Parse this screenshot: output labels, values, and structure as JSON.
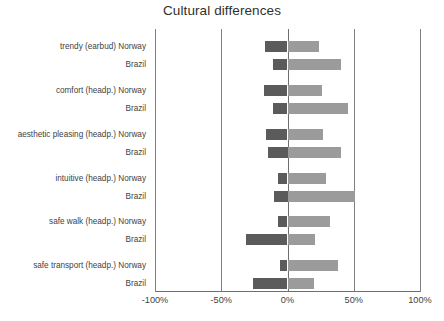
{
  "chart_data": {
    "type": "bar",
    "subtype": "diverging-stacked-bar",
    "title": "Cultural differences",
    "xlabel": "",
    "ylabel": "",
    "xlim": [
      -100,
      100
    ],
    "xticks": [
      -100,
      -50,
      0,
      50,
      100
    ],
    "xticklabels": [
      "-100%",
      "-50%",
      "0%",
      "50%",
      "100%"
    ],
    "grid": true,
    "legend": null,
    "orientation": "horizontal",
    "series": [
      {
        "name": "negative",
        "color": "#5b5b5b"
      },
      {
        "name": "positive",
        "color": "#9b9b9b"
      }
    ],
    "groups": [
      {
        "category": "trendy (earbud)",
        "bars": [
          {
            "label": "trendy (earbud) Norway",
            "country": "Norway",
            "negative": -17,
            "positive": 24
          },
          {
            "label": "Brazil",
            "country": "Brazil",
            "negative": -11,
            "positive": 40
          }
        ]
      },
      {
        "category": "comfort (headp.)",
        "bars": [
          {
            "label": "comfort (headp.) Norway",
            "country": "Norway",
            "negative": -18,
            "positive": 26
          },
          {
            "label": "Brazil",
            "country": "Brazil",
            "negative": -11,
            "positive": 46
          }
        ]
      },
      {
        "category": "aesthetic pleasing (headp.)",
        "bars": [
          {
            "label": "aesthetic pleasing (headp.) Norway",
            "country": "Norway",
            "negative": -16,
            "positive": 27
          },
          {
            "label": "Brazil",
            "country": "Brazil",
            "negative": -15,
            "positive": 40
          }
        ]
      },
      {
        "category": "intuitive (headp.)",
        "bars": [
          {
            "label": "intuitive (headp.) Norway",
            "country": "Norway",
            "negative": -7,
            "positive": 29
          },
          {
            "label": "Brazil",
            "country": "Brazil",
            "negative": -10,
            "positive": 51
          }
        ]
      },
      {
        "category": "safe walk (headp.)",
        "bars": [
          {
            "label": "safe walk (headp.) Norway",
            "country": "Norway",
            "negative": -7,
            "positive": 32
          },
          {
            "label": "Brazil",
            "country": "Brazil",
            "negative": -31,
            "positive": 21
          }
        ]
      },
      {
        "category": "safe transport (headp.)",
        "bars": [
          {
            "label": "safe transport (headp.) Norway",
            "country": "Norway",
            "negative": -6,
            "positive": 38
          },
          {
            "label": "Brazil",
            "country": "Brazil",
            "negative": -26,
            "positive": 20
          }
        ]
      }
    ]
  }
}
